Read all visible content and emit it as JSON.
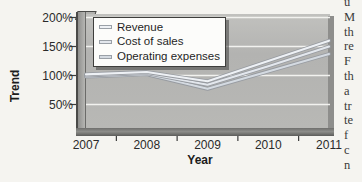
{
  "chart_data": {
    "type": "line",
    "title": "",
    "xlabel": "Year",
    "ylabel": "Trend",
    "value_format": "percent",
    "x_labels": [
      "2007",
      "2008",
      "2009",
      "2010",
      "2011"
    ],
    "ytick_labels": [
      "200%",
      "150%",
      "100%",
      "50%"
    ],
    "ytick_values": [
      200,
      150,
      100,
      50
    ],
    "ylim": [
      0,
      200
    ],
    "grid": true,
    "legend_position": "top-left-inside",
    "series": [
      {
        "name": "Revenue",
        "values": [
          102,
          106,
          90,
          125,
          160
        ],
        "color": "#eef1f5"
      },
      {
        "name": "Cost of sales",
        "values": [
          100,
          104,
          84,
          116,
          150
        ],
        "color": "#e3e7ed"
      },
      {
        "name": "Operating expenses",
        "values": [
          98,
          102,
          77,
          107,
          137
        ],
        "color": "#d4dae1"
      }
    ],
    "line_edge_color": "#979ba1"
  },
  "page_edge_text": {
    "fragments": [
      "u",
      "M",
      "th",
      "re",
      "F",
      "th",
      "a",
      "tr",
      "te",
      "f",
      "c",
      "n"
    ]
  },
  "colors": {
    "page_background": "#f5f4f0",
    "plot_background": "#b6b6b3",
    "gridline": "#f2f2ef",
    "axis_dark": "#3c3c3c",
    "legend_background": "#fcfcfa",
    "legend_border": "#3e3e3c",
    "text": "#2a2a2a"
  }
}
